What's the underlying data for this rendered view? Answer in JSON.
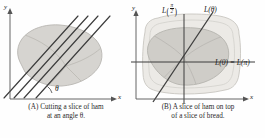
{
  "figure": {
    "background_color": "#fefefe",
    "ham_fill": "#d6d4d0",
    "ham_inner_fill": "#c6c4bf",
    "bread_fill": "#eceae6",
    "line_color": "#3c3c3c",
    "axis_color": "#555555"
  },
  "panel_a": {
    "id": "A",
    "caption_line1": "(A) Cutting a slice of ham",
    "caption_line2": "at an angle θ.",
    "axis_x_label": "x",
    "axis_y_label": "y",
    "angle_label": "θ",
    "cut_line_count": 4,
    "shape_name": "ham-slice"
  },
  "panel_b": {
    "id": "B",
    "caption_line1": "(B) A slice of ham on top",
    "caption_line2": "of a slice of bread.",
    "axis_x_label": "x",
    "axis_y_label": "y",
    "label_vertical_L": "L",
    "label_vertical_arg_num": "π",
    "label_vertical_arg_den": "2",
    "label_diagonal": "L(θ)",
    "label_horizontal": "L(0) = L(π)",
    "shapes": [
      "bread-slice",
      "ham-slice"
    ]
  }
}
